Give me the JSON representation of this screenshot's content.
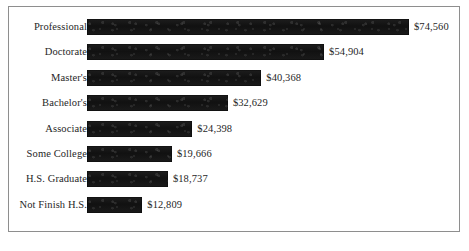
{
  "chart_data": {
    "type": "bar",
    "orientation": "horizontal",
    "title": "",
    "subtitle": "",
    "xlabel": "",
    "ylabel": "",
    "grid": false,
    "legend": false,
    "legend_position": "none",
    "axis_visible": false,
    "tick_labels": [],
    "xlim": [
      0,
      74560
    ],
    "categories": [
      "Professional",
      "Doctorate",
      "Master's",
      "Bachelor's",
      "Associate",
      "Some College",
      "H.S. Graduate",
      "Not Finish H.S."
    ],
    "values": [
      74560,
      54904,
      40368,
      32629,
      24398,
      19666,
      18737,
      12809
    ],
    "value_labels": [
      "$74,560",
      "$54,904",
      "$40,368",
      "$32,629",
      "$24,398",
      "$19,666",
      "$18,737",
      "$12,809"
    ],
    "bar_color": "#161616",
    "frame_color": "#8e8e8e",
    "background_color": "#ffffff",
    "text_color": "#262626"
  },
  "figure": {
    "name": "earnings-by-education-bar-chart"
  }
}
